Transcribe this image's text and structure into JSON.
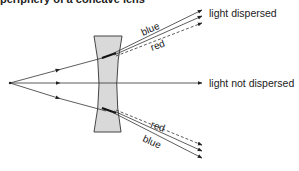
{
  "caption": "periphery of a concave lens",
  "labels": {
    "top_output": "light dispersed",
    "middle_output": "light not dispersed",
    "upper_blue": "blue",
    "upper_red": "red",
    "lower_red": "red",
    "lower_blue": "blue"
  },
  "colors": {
    "line": "#333333",
    "lens_fill": "#d9d9d9",
    "lens_stroke": "#444444",
    "text": "#222222"
  }
}
